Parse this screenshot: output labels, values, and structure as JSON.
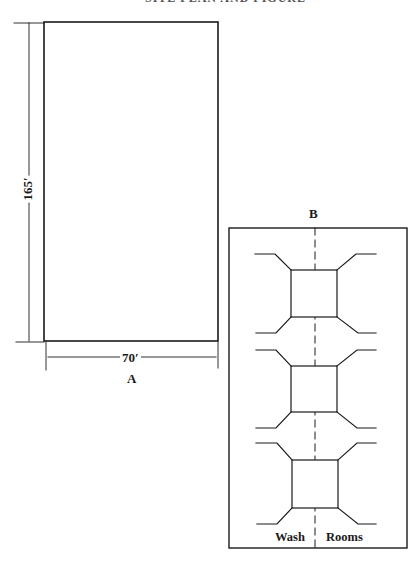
{
  "header": {
    "text": "SITE PLAN AND FIGURE 1"
  },
  "figure_a": {
    "label": "A",
    "height_dimension": "165′",
    "width_dimension": "70′"
  },
  "figure_b": {
    "label": "B",
    "bottom_labels": {
      "left": "Wash",
      "right": "Rooms"
    },
    "unit_count": 3
  },
  "colors": {
    "line": "#1a1a1a",
    "background": "#ffffff"
  }
}
